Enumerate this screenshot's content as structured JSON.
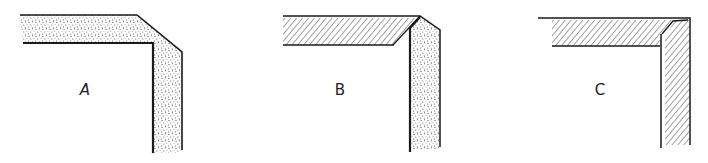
{
  "diagram": {
    "panels": [
      {
        "label": "A",
        "joint": "beveled corner, single continuous member",
        "fill": "stipple",
        "label_x": 85,
        "label_y": 90
      },
      {
        "label": "B",
        "joint": "mitered corner, two different materials",
        "fill_horizontal": "hatch",
        "fill_vertical": "stipple",
        "label_x": 340,
        "label_y": 90
      },
      {
        "label": "C",
        "joint": "mitered corner, same material",
        "fill_horizontal": "hatch",
        "fill_vertical": "hatch",
        "label_x": 600,
        "label_y": 90
      }
    ]
  },
  "colors": {
    "line": "#1a1a1a",
    "background": "#ffffff"
  }
}
